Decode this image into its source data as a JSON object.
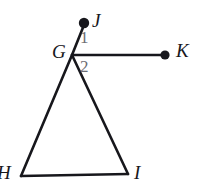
{
  "figure": {
    "background_color": "#ffffff",
    "stroke_color": "#17171c",
    "angle_label_color": "#6d6d73",
    "width": 209,
    "height": 190
  },
  "points": {
    "G": {
      "label": "G",
      "x": 72,
      "y": 55
    },
    "H": {
      "label": "H",
      "x": 21,
      "y": 176
    },
    "I": {
      "label": "I",
      "x": 128,
      "y": 174
    },
    "J": {
      "label": "J",
      "x": 84,
      "y": 24,
      "dot": true
    },
    "K": {
      "label": "K",
      "x": 165,
      "y": 55,
      "dot": true
    }
  },
  "segments": [
    {
      "name": "GJ",
      "from": "G",
      "to": "J"
    },
    {
      "name": "GK",
      "from": "G",
      "to": "K"
    },
    {
      "name": "GH",
      "from": "G",
      "to": "H"
    },
    {
      "name": "GI",
      "from": "G",
      "to": "I"
    },
    {
      "name": "HI",
      "from": "H",
      "to": "I"
    }
  ],
  "angles": [
    {
      "name": "angle-1",
      "label": "1",
      "between": "GJ and GK"
    },
    {
      "name": "angle-2",
      "label": "2",
      "between": "GK and GI"
    }
  ]
}
